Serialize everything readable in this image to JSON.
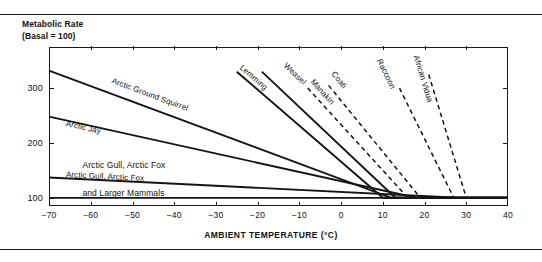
{
  "figure": {
    "axis_title_y": "Metabolic Rate\n(Basal = 100)",
    "axis_title_x": "AMBIENT TEMPERATURE (°C)"
  },
  "chart_data": {
    "type": "line",
    "title": "Metabolic Rate (Basal = 100)",
    "subtitle": "",
    "xlabel": "AMBIENT TEMPERATURE (°C)",
    "ylabel": "Metabolic Rate (Basal = 100)",
    "xlim": [
      -70,
      40
    ],
    "ylim": [
      85,
      375
    ],
    "xticks": [
      -70,
      -60,
      -50,
      -40,
      -30,
      -20,
      -10,
      0,
      10,
      20,
      30,
      40
    ],
    "xtick_labels": [
      "−70",
      "−60",
      "−50",
      "−40",
      "−30",
      "−20",
      "−10",
      "0",
      "10",
      "20",
      "30",
      "40"
    ],
    "yticks": [
      100,
      200,
      300
    ],
    "ytick_labels": [
      "100",
      "200",
      "300"
    ],
    "grid": false,
    "legend": "inline-labels",
    "baseline": 100,
    "series": [
      {
        "name": "Arctic Ground Squirrel",
        "style": "solid",
        "label_anchor": {
          "x": -55.0,
          "y": 322
        },
        "points": [
          [
            -70,
            332
          ],
          [
            12,
            100
          ],
          [
            40,
            100
          ]
        ]
      },
      {
        "name": "Arctic Jay",
        "style": "solid",
        "label_anchor": {
          "x": -66.0,
          "y": 243
        },
        "points": [
          [
            -70,
            248
          ],
          [
            18,
            100
          ],
          [
            40,
            100
          ]
        ]
      },
      {
        "name": "Arctic Gull, Arctic Fox",
        "style": "solid",
        "label_anchor": {
          "x": -66.0,
          "y": 150
        },
        "points": [
          [
            -70,
            137
          ],
          [
            28,
            100
          ],
          [
            40,
            100
          ]
        ]
      },
      {
        "name": "Lemming",
        "style": "solid",
        "label_anchor": {
          "x": -24.0,
          "y": 348
        },
        "points": [
          [
            -25,
            330
          ],
          [
            10,
            100
          ],
          [
            40,
            100
          ]
        ]
      },
      {
        "name": "Weasel",
        "style": "solid",
        "label_anchor": {
          "x": -13.5,
          "y": 352
        },
        "points": [
          [
            -19,
            330
          ],
          [
            13,
            100
          ],
          [
            40,
            100
          ]
        ]
      },
      {
        "name": "Manakin",
        "style": "dashed",
        "label_anchor": {
          "x": -7.0,
          "y": 323
        },
        "points": [
          [
            -8,
            300
          ],
          [
            16,
            100
          ],
          [
            40,
            100
          ]
        ]
      },
      {
        "name": "Coati",
        "style": "dashed",
        "label_anchor": {
          "x": -2.0,
          "y": 337
        },
        "points": [
          [
            -3,
            305
          ],
          [
            19,
            100
          ],
          [
            40,
            100
          ]
        ]
      },
      {
        "name": "Raccoon",
        "style": "dashed",
        "label_anchor": {
          "x": 9.0,
          "y": 360
        },
        "points": [
          [
            14,
            300
          ],
          [
            27,
            100
          ],
          [
            40,
            100
          ]
        ]
      },
      {
        "name": "African Vidua",
        "style": "dashed",
        "label_anchor": {
          "x": 18.0,
          "y": 368
        },
        "points": [
          [
            21,
            325
          ],
          [
            30,
            100
          ],
          [
            40,
            100
          ]
        ]
      }
    ],
    "baseline_series": {
      "name": "basal-baseline",
      "style": "solid",
      "points": [
        [
          -70,
          100
        ],
        [
          40,
          100
        ]
      ]
    },
    "flat_labels": [
      {
        "text": "Arctic Gull, Arctic Fox",
        "x": -62,
        "y": 160
      },
      {
        "text": "and Larger Mammals",
        "x": -62,
        "y": 108
      }
    ]
  }
}
